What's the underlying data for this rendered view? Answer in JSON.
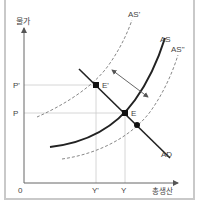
{
  "diagram": {
    "y_axis_label": "물가",
    "x_axis_label": "총생산",
    "origin_label": "0",
    "price_levels": {
      "p_prime": "P'",
      "p": "P"
    },
    "output_levels": {
      "y_prime": "Y'",
      "y": "Y"
    },
    "curves": {
      "as": "AS",
      "as_prime": "AS'",
      "as_double_prime": "AS\"",
      "ad": "AD"
    },
    "points": {
      "e_prime": "E'",
      "e": "E"
    },
    "colors": {
      "axis": "#666666",
      "curve": "#222222",
      "dashed": "#888888",
      "grid": "#cccccc",
      "frame": "#c9c9c9"
    }
  }
}
